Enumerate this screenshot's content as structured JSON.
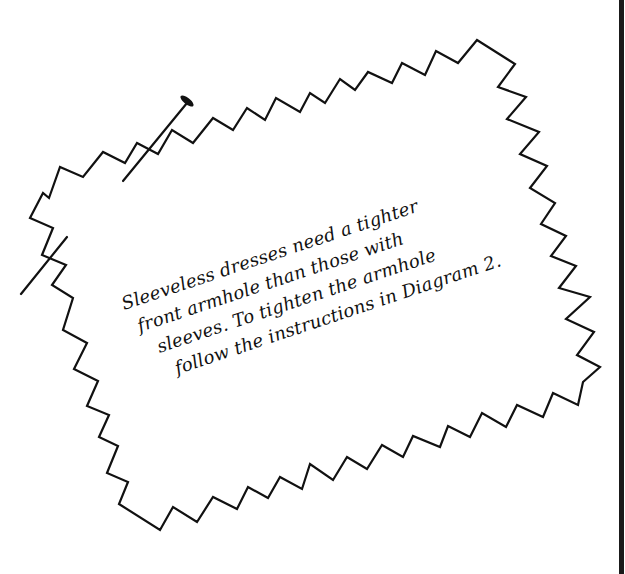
{
  "figure": {
    "type": "pinned-fabric-note-illustration",
    "note": {
      "lines": [
        "Sleeveless dresses need a tighter",
        "front armhole than those with",
        "sleeves. To tighten the armhole",
        "follow the instructions in Diagram 2."
      ],
      "line_indents_px": [
        0,
        8,
        20,
        30
      ],
      "rotation_deg": -18.5
    },
    "shapes": {
      "pinked_fabric_outline": {
        "description": "zigzag (pinked) fabric edge outline",
        "stroke": "#111111",
        "points": [
          [
            30,
            218
          ],
          [
            43,
            193
          ],
          [
            49,
            198
          ],
          [
            60,
            167
          ],
          [
            83,
            177
          ],
          [
            103,
            152
          ],
          [
            125,
            163
          ],
          [
            137,
            143
          ],
          [
            158,
            154
          ],
          [
            172,
            130
          ],
          [
            193,
            143
          ],
          [
            213,
            118
          ],
          [
            233,
            130
          ],
          [
            247,
            108
          ],
          [
            265,
            120
          ],
          [
            276,
            98
          ],
          [
            300,
            112
          ],
          [
            310,
            93
          ],
          [
            325,
            103
          ],
          [
            340,
            79
          ],
          [
            355,
            90
          ],
          [
            368,
            72
          ],
          [
            392,
            83
          ],
          [
            402,
            63
          ],
          [
            425,
            75
          ],
          [
            436,
            51
          ],
          [
            458,
            63
          ],
          [
            477,
            40
          ],
          [
            515,
            64
          ],
          [
            498,
            87
          ],
          [
            526,
            97
          ],
          [
            507,
            119
          ],
          [
            539,
            132
          ],
          [
            520,
            154
          ],
          [
            547,
            166
          ],
          [
            530,
            188
          ],
          [
            555,
            203
          ],
          [
            541,
            224
          ],
          [
            566,
            236
          ],
          [
            551,
            256
          ],
          [
            576,
            266
          ],
          [
            559,
            288
          ],
          [
            590,
            297
          ],
          [
            566,
            319
          ],
          [
            594,
            332
          ],
          [
            577,
            355
          ],
          [
            600,
            367
          ],
          [
            583,
            382
          ],
          [
            578,
            405
          ],
          [
            553,
            393
          ],
          [
            543,
            417
          ],
          [
            517,
            405
          ],
          [
            506,
            427
          ],
          [
            482,
            413
          ],
          [
            470,
            437
          ],
          [
            448,
            426
          ],
          [
            440,
            447
          ],
          [
            413,
            436
          ],
          [
            403,
            457
          ],
          [
            382,
            445
          ],
          [
            367,
            469
          ],
          [
            347,
            457
          ],
          [
            333,
            480
          ],
          [
            310,
            464
          ],
          [
            302,
            489
          ],
          [
            280,
            477
          ],
          [
            268,
            498
          ],
          [
            248,
            487
          ],
          [
            237,
            509
          ],
          [
            213,
            497
          ],
          [
            197,
            522
          ],
          [
            173,
            507
          ],
          [
            160,
            530
          ],
          [
            119,
            504
          ],
          [
            128,
            482
          ],
          [
            107,
            473
          ],
          [
            118,
            446
          ],
          [
            99,
            437
          ],
          [
            109,
            415
          ],
          [
            87,
            406
          ],
          [
            98,
            381
          ],
          [
            74,
            369
          ],
          [
            87,
            343
          ],
          [
            63,
            330
          ],
          [
            73,
            298
          ],
          [
            52,
            285
          ],
          [
            66,
            265
          ],
          [
            42,
            255
          ],
          [
            53,
            228
          ]
        ]
      },
      "pins": [
        {
          "name": "top-pin",
          "shaft": [
            [
              123,
              181
            ],
            [
              187,
              103
            ]
          ],
          "head": {
            "cx": 187,
            "cy": 101,
            "rx": 8,
            "ry": 3.2,
            "rotate": 38
          }
        },
        {
          "name": "left-pin",
          "shaft": [
            [
              21,
              294
            ],
            [
              67,
              237
            ]
          ]
        }
      ],
      "edge_bar": {
        "x": 619,
        "width": 5,
        "color": "#1a1a1a"
      }
    },
    "colors": {
      "background": "#ffffff",
      "ink": "#111111"
    }
  }
}
